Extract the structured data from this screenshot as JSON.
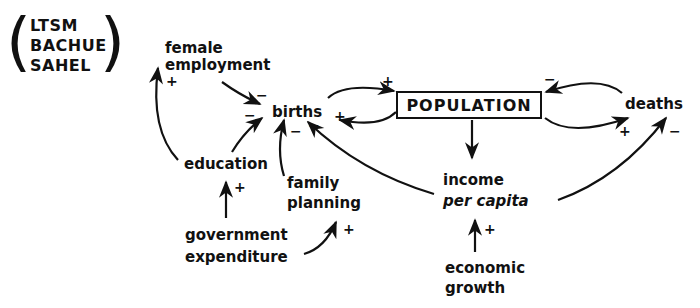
{
  "models": {
    "lines": [
      "LTSM",
      "BACHUE",
      "SAHEL"
    ]
  },
  "nodes": {
    "female_employment": [
      "female",
      "employment"
    ],
    "births": "births",
    "population": "POPULATION",
    "deaths": "deaths",
    "education": "education",
    "family_planning": [
      "family",
      "planning"
    ],
    "government_expenditure": [
      "government",
      "expenditure"
    ],
    "income_per_capita": [
      "income",
      "per capita"
    ],
    "economic_growth": [
      "economic",
      "growth"
    ]
  },
  "links": [
    {
      "from": "female employment",
      "to": "births",
      "sign": "−"
    },
    {
      "from": "education",
      "to": "births",
      "sign": "−"
    },
    {
      "from": "education",
      "to": "female employment",
      "sign": "+"
    },
    {
      "from": "government expenditure",
      "to": "education",
      "sign": "+"
    },
    {
      "from": "government expenditure",
      "to": "family planning",
      "sign": "+"
    },
    {
      "from": "family planning",
      "to": "births",
      "sign": "−"
    },
    {
      "from": "income per capita",
      "to": "births",
      "sign": "−"
    },
    {
      "from": "births",
      "to": "POPULATION",
      "sign": "+"
    },
    {
      "from": "POPULATION",
      "to": "births",
      "sign": "+"
    },
    {
      "from": "POPULATION",
      "to": "deaths",
      "sign": "+"
    },
    {
      "from": "deaths",
      "to": "POPULATION",
      "sign": "−"
    },
    {
      "from": "POPULATION",
      "to": "income per capita",
      "sign": ""
    },
    {
      "from": "income per capita",
      "to": "deaths",
      "sign": "−"
    },
    {
      "from": "economic growth",
      "to": "income per capita",
      "sign": "+"
    }
  ],
  "signs": {
    "fe_births": "−",
    "edu_births": "−",
    "edu_fe": "+",
    "gov_edu": "+",
    "gov_fp": "+",
    "fp_births": "−",
    "inc_births": "−",
    "births_pop": "+",
    "pop_births": "+",
    "pop_deaths": "+",
    "deaths_pop": "−",
    "inc_deaths": "−",
    "eg_inc": "+"
  }
}
